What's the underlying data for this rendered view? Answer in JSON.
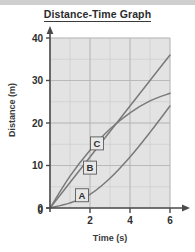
{
  "figure": {
    "title": "Distance-Time Graph",
    "background_color": "#ffffff",
    "plot_background_color": "#e3e3e3",
    "top_band_color": "#cfcfcf"
  },
  "chart_data": {
    "type": "line",
    "title": "Distance-Time Graph",
    "xlabel": "Time (s)",
    "ylabel": "Distance (m)",
    "xlim": [
      0,
      6
    ],
    "ylim": [
      0,
      40
    ],
    "xticks": [
      0,
      2,
      4,
      6
    ],
    "yticks": [
      0,
      10,
      20,
      30,
      40
    ],
    "x_minor_step": 1,
    "y_minor_step": 5,
    "grid": true,
    "legend": "inline-curve-labels",
    "axis_arrows": true,
    "series": [
      {
        "name": "A",
        "shape": "concave-up",
        "description": "accelerating: speed increases with time",
        "x": [
          0,
          1,
          2,
          3,
          4,
          5,
          6
        ],
        "values": [
          0,
          1.2,
          3.2,
          7.0,
          12.0,
          17.8,
          24.0
        ],
        "label_x": 1.6,
        "label_y": 3.0,
        "color": "#7a7a7a"
      },
      {
        "name": "B",
        "shape": "straight",
        "description": "constant speed: 6 m/s",
        "x": [
          0,
          1,
          2,
          3,
          4,
          5,
          6
        ],
        "values": [
          0,
          6,
          12,
          18,
          24,
          30,
          36
        ],
        "label_x": 2.0,
        "label_y": 9.5,
        "color": "#7a7a7a"
      },
      {
        "name": "C",
        "shape": "concave-down",
        "description": "decelerating: speed decreases with time",
        "x": [
          0,
          1,
          2,
          3,
          4,
          5,
          6
        ],
        "values": [
          0,
          7.5,
          13.6,
          18.6,
          22.4,
          25.2,
          27.0
        ],
        "label_x": 2.35,
        "label_y": 15.2,
        "color": "#7a7a7a"
      }
    ]
  },
  "axes": {
    "y_tick_labels": [
      "40",
      "30",
      "20",
      "10",
      "0"
    ],
    "x_tick_labels": [
      "2",
      "4",
      "6"
    ],
    "origin_label": "0",
    "x_axis_title": "Time (s)",
    "y_axis_title": "Distance (m)"
  },
  "curve_labels": [
    {
      "text": "C"
    },
    {
      "text": "B"
    },
    {
      "text": "A"
    }
  ]
}
